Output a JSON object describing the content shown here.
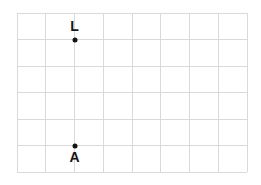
{
  "figure": {
    "background_color": "#ffffff",
    "grid": {
      "line_color": "#d9d9d9",
      "columns": 8,
      "rows": 6,
      "x_start": 17,
      "y_start": 13,
      "cell_width": 28.75,
      "cell_height": 26.5,
      "x_lines": [
        17,
        45.75,
        74.5,
        103.25,
        132,
        160.75,
        189.5,
        218.25,
        247
      ],
      "y_lines": [
        13,
        39.5,
        66,
        92.5,
        119,
        145.5,
        172
      ]
    },
    "point_color": "#141414",
    "points": [
      {
        "label": "L",
        "x": 74.5,
        "y": 39.5,
        "grid_col": 2,
        "grid_row": 1,
        "label_position": "above",
        "label_x": 74.5,
        "label_y": 19
      },
      {
        "label": "A",
        "x": 74.5,
        "y": 145.5,
        "grid_col": 2,
        "grid_row": 5,
        "label_position": "below",
        "label_x": 74.5,
        "label_y": 150
      }
    ]
  }
}
